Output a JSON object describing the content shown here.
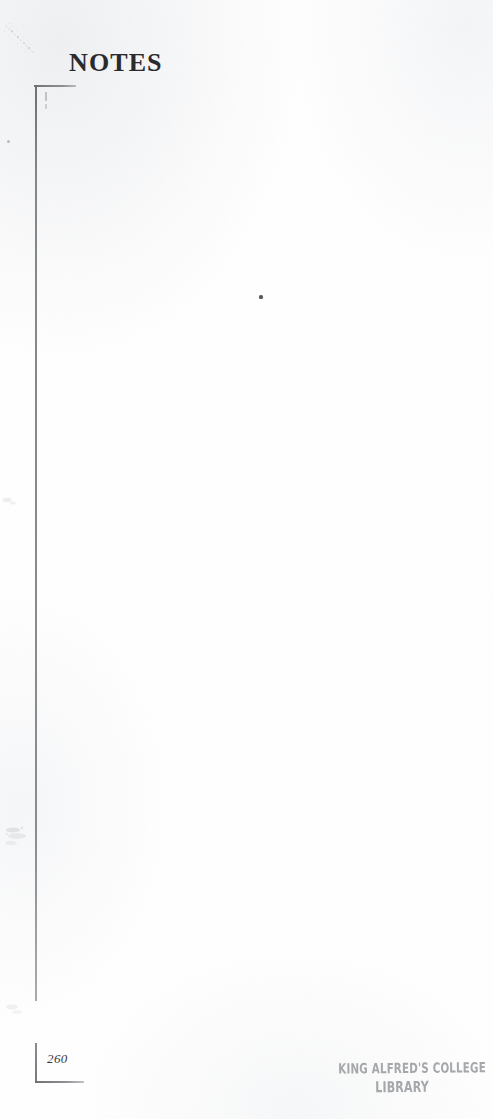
{
  "page": {
    "width": 493,
    "height": 1119,
    "background_color": "#ffffff",
    "document_type": "scanned-book-page",
    "heading": "NOTES",
    "folio": "260"
  },
  "heading": {
    "text": "NOTES",
    "color": "#2b2b2d"
  },
  "frame": {
    "rule_color": "#8d8f93",
    "top_rule_name": "frame-top-rule",
    "left_rule_name": "frame-left-rule",
    "bottom_rule_name": "frame-bottom-rule"
  },
  "folio": {
    "number": "260",
    "color": "#3b3b3d"
  },
  "library_stamp": {
    "line1": "KING ALFRED'S COLLEGE",
    "line2": "LIBRARY",
    "color": "#9a9c9f"
  },
  "artifacts": {
    "smudge_topleft": "diagonal-scan-smudge",
    "speck_center": "ink-speck",
    "speck_upper_left": "ink-speck",
    "smudge_left_lower": "edge-smudge",
    "smudge_left_mid": "edge-smudge",
    "smudge_bottom_left": "edge-smudge"
  }
}
